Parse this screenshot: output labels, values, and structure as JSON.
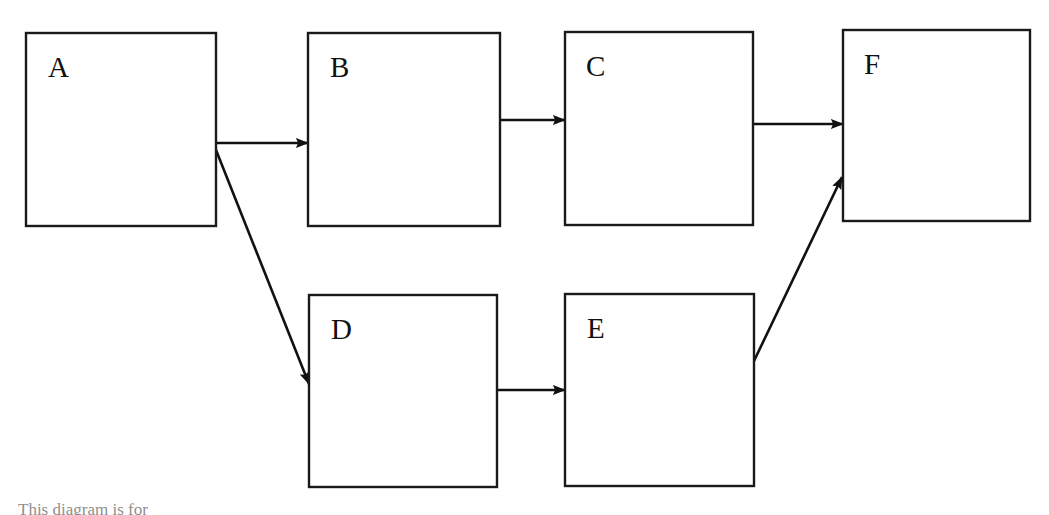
{
  "document": {
    "title": "Block flow diagram",
    "background_color": "#ffffff",
    "line_color": "#111111",
    "text_color": "#101010"
  },
  "diagram": {
    "type": "flowchart",
    "orientation": "left-to-right",
    "nodes": [
      {
        "id": "A",
        "label": "A",
        "x": 26,
        "y": 33,
        "width": 190,
        "height": 193,
        "label_x": 48,
        "label_y": 77
      },
      {
        "id": "B",
        "label": "B",
        "x": 308,
        "y": 33,
        "width": 192,
        "height": 193,
        "label_x": 330,
        "label_y": 77
      },
      {
        "id": "C",
        "label": "C",
        "x": 565,
        "y": 32,
        "width": 188,
        "height": 193,
        "label_x": 586,
        "label_y": 76
      },
      {
        "id": "F",
        "label": "F",
        "x": 843,
        "y": 30,
        "width": 187,
        "height": 191,
        "label_x": 864,
        "label_y": 74
      },
      {
        "id": "D",
        "label": "D",
        "x": 309,
        "y": 295,
        "width": 188,
        "height": 192,
        "label_x": 331,
        "label_y": 339
      },
      {
        "id": "E",
        "label": "E",
        "x": 565,
        "y": 294,
        "width": 189,
        "height": 192,
        "label_x": 587,
        "label_y": 338
      }
    ],
    "edges": [
      {
        "id": "A-B",
        "from": "A",
        "to": "B",
        "kind": "straight",
        "x1": 216,
        "y1": 143,
        "x2": 308,
        "y2": 143
      },
      {
        "id": "A-D",
        "from": "A",
        "to": "D",
        "kind": "diagonal",
        "x1": 216,
        "y1": 150,
        "x2": 309,
        "y2": 384
      },
      {
        "id": "B-C",
        "from": "B",
        "to": "C",
        "kind": "straight",
        "x1": 500,
        "y1": 120,
        "x2": 565,
        "y2": 120
      },
      {
        "id": "C-F",
        "from": "C",
        "to": "F",
        "kind": "straight",
        "x1": 753,
        "y1": 124,
        "x2": 843,
        "y2": 124
      },
      {
        "id": "D-E",
        "from": "D",
        "to": "E",
        "kind": "straight",
        "x1": 497,
        "y1": 390,
        "x2": 565,
        "y2": 390
      },
      {
        "id": "E-F",
        "from": "E",
        "to": "F",
        "kind": "diagonal",
        "x1": 754,
        "y1": 361,
        "x2": 842,
        "y2": 177
      }
    ]
  },
  "caption": {
    "text": "This diagram is for"
  }
}
